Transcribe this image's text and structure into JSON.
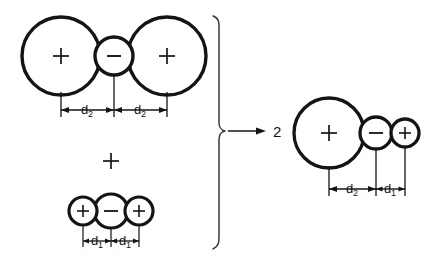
{
  "figure": {
    "type": "reaction-schematic",
    "background_color": "#ffffff",
    "ink_color": "#141414",
    "brace_color": "#3a3a3a"
  },
  "reactants": {
    "top_structure": {
      "name": "symmetric-triple-ion-large",
      "particles": [
        {
          "label": "+",
          "size": "large"
        },
        {
          "label": "−",
          "size": "small"
        },
        {
          "label": "+",
          "size": "large"
        }
      ],
      "dimensions": [
        {
          "base": "d",
          "sub": "2"
        },
        {
          "base": "d",
          "sub": "2"
        }
      ]
    },
    "operator": "+",
    "bottom_structure": {
      "name": "symmetric-triple-ion-small",
      "particles": [
        {
          "label": "+",
          "size": "small"
        },
        {
          "label": "−",
          "size": "medium"
        },
        {
          "label": "+",
          "size": "small"
        }
      ],
      "dimensions": [
        {
          "base": "d",
          "sub": "1"
        },
        {
          "base": "d",
          "sub": "1"
        }
      ]
    }
  },
  "arrow": {
    "name": "reaction-arrow",
    "direction": "right"
  },
  "product": {
    "coefficient": "2",
    "structure": {
      "name": "asymmetric-triple-ion",
      "particles": [
        {
          "label": "+",
          "size": "large"
        },
        {
          "label": "−",
          "size": "medium"
        },
        {
          "label": "+",
          "size": "small"
        }
      ],
      "dimensions": [
        {
          "base": "d",
          "sub": "2"
        },
        {
          "base": "d",
          "sub": "1"
        }
      ]
    }
  }
}
